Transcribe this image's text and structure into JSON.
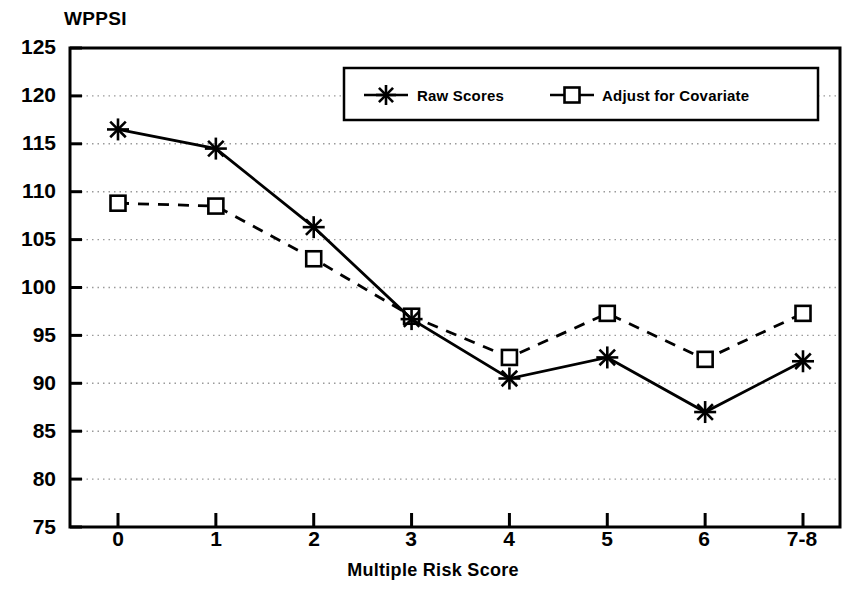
{
  "chart_data": {
    "type": "line",
    "title": "",
    "ylabel": "WPPSI",
    "xlabel": "Multiple Risk Score",
    "categories": [
      "0",
      "1",
      "2",
      "3",
      "4",
      "5",
      "6",
      "7-8"
    ],
    "ylim": [
      75,
      125
    ],
    "yticks": [
      75,
      80,
      85,
      90,
      95,
      100,
      105,
      110,
      115,
      120,
      125
    ],
    "grid": true,
    "legend_position": "top-center",
    "series": [
      {
        "name": "Raw Scores",
        "marker": "asterisk",
        "line_style": "solid",
        "color": "#000000",
        "values": [
          116.5,
          114.5,
          106.3,
          96.7,
          90.5,
          92.7,
          87.0,
          92.3
        ]
      },
      {
        "name": "Adjust for Covariate",
        "marker": "square",
        "line_style": "dashed",
        "color": "#000000",
        "values": [
          108.8,
          108.5,
          103.0,
          97.0,
          92.7,
          97.3,
          92.5,
          97.3
        ]
      }
    ]
  },
  "axes": {
    "y_title": "WPPSI",
    "x_title": "Multiple Risk Score",
    "y_labels": [
      "125",
      "120",
      "115",
      "110",
      "105",
      "100",
      "95",
      "90",
      "85",
      "80",
      "75"
    ],
    "x_labels": [
      "0",
      "1",
      "2",
      "3",
      "4",
      "5",
      "6",
      "7-8"
    ]
  },
  "legend": {
    "items": [
      {
        "label": "Raw Scores",
        "marker": "asterisk-marker"
      },
      {
        "label": "Adjust for Covariate",
        "marker": "square-marker"
      }
    ]
  }
}
